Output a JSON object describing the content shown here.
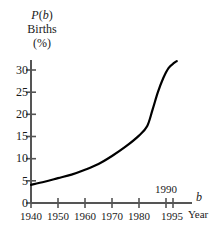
{
  "chart_data": {
    "type": "line",
    "title": "",
    "ylabel_lines": [
      "P(b)",
      "Births",
      "(%)"
    ],
    "ylabel_var": "P",
    "ylabel_arg": "b",
    "xlabel_var": "b",
    "xlabel": "Year",
    "ylabel": "Births (%)",
    "xlim": [
      1940,
      1996
    ],
    "ylim": [
      0,
      34
    ],
    "yticks": [
      0,
      5,
      10,
      15,
      20,
      25,
      30
    ],
    "ytick_labels": [
      "0",
      "5",
      "10",
      "15",
      "20",
      "25",
      "30"
    ],
    "xticks": [
      1940,
      1950,
      1960,
      1970,
      1980,
      1990,
      1995
    ],
    "xtick_labels_below": [
      "1940",
      "1950",
      "1960",
      "1970",
      "1980",
      "1995"
    ],
    "xtick_label_above": "1990",
    "grid": false,
    "legend": null,
    "x": [
      1940,
      1945,
      1950,
      1955,
      1960,
      1965,
      1970,
      1975,
      1980,
      1983,
      1985,
      1987,
      1989,
      1991,
      1993,
      1994
    ],
    "values": [
      4.1,
      4.8,
      5.6,
      6.4,
      7.5,
      8.8,
      10.6,
      12.7,
      15.2,
      17.3,
      21.0,
      25.0,
      28.2,
      30.5,
      31.6,
      32.0
    ],
    "series": [
      {
        "name": "P(b)",
        "values": [
          4.1,
          4.8,
          5.6,
          6.4,
          7.5,
          8.8,
          10.6,
          12.7,
          15.2,
          17.3,
          21.0,
          25.0,
          28.2,
          30.5,
          31.6,
          32.0
        ]
      }
    ],
    "colors": {
      "curve": "#000000",
      "axis": "#555555",
      "text": "#1a1a1a",
      "background": "#ffffff"
    }
  }
}
